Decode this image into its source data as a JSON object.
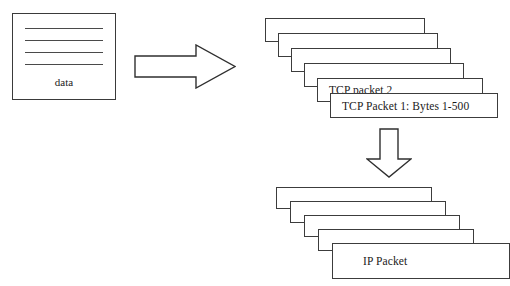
{
  "diagram": {
    "background_color": "#ffffff",
    "line_color": "#3a3a3a"
  },
  "source": {
    "name": "data-document",
    "label": "data",
    "rule_count": 4
  },
  "arrows": [
    {
      "name": "arrow-right",
      "direction": "right",
      "glyph": "⇒"
    },
    {
      "name": "arrow-down",
      "direction": "down",
      "glyph": "⇓"
    }
  ],
  "tcp_stack": {
    "name": "tcp-packet-stack",
    "count": 6,
    "packets": [
      {
        "label": ""
      },
      {
        "label": ""
      },
      {
        "label": ""
      },
      {
        "label": ""
      },
      {
        "label": "TCP packet 2"
      },
      {
        "label": "TCP Packet 1: Bytes 1-500"
      }
    ]
  },
  "ip_stack": {
    "name": "ip-packet-stack",
    "count": 5,
    "packets": [
      {
        "label": ""
      },
      {
        "label": ""
      },
      {
        "label": ""
      },
      {
        "label": ""
      },
      {
        "label": "IP Packet"
      }
    ]
  }
}
